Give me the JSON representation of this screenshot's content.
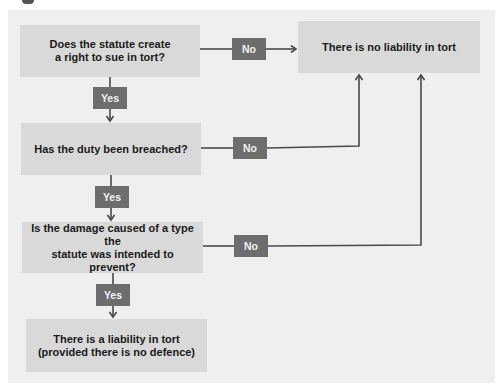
{
  "diagram": {
    "type": "flowchart",
    "colors": {
      "panel_background": "#efefef",
      "box_fill": "#d9d9d9",
      "label_fill": "#6d6d6d",
      "line_color": "#4a4a4a",
      "text_color": "#1a1a1a"
    },
    "nodes": {
      "q1": {
        "line1": "Does the statute create",
        "line2": "a right to sue in tort?"
      },
      "q2": {
        "line1": "Has the duty been breached?"
      },
      "q3": {
        "line1": "Is the damage caused of a type the",
        "line2": "statute was intended to prevent?"
      },
      "outcome_liable": {
        "line1": "There is a liability in tort",
        "line2": "(provided there is no defence)"
      },
      "outcome_not_liable": {
        "line1": "There is no liability in tort"
      }
    },
    "edge_labels": {
      "q1_yes": "Yes",
      "q2_yes": "Yes",
      "q3_yes": "Yes",
      "q1_no": "No",
      "q2_no": "No",
      "q3_no": "No"
    },
    "edges": [
      {
        "from": "q1",
        "to": "q2",
        "label": "Yes"
      },
      {
        "from": "q2",
        "to": "q3",
        "label": "Yes"
      },
      {
        "from": "q3",
        "to": "outcome_liable",
        "label": "Yes"
      },
      {
        "from": "q1",
        "to": "outcome_not_liable",
        "label": "No"
      },
      {
        "from": "q2",
        "to": "outcome_not_liable",
        "label": "No"
      },
      {
        "from": "q3",
        "to": "outcome_not_liable",
        "label": "No"
      }
    ]
  }
}
